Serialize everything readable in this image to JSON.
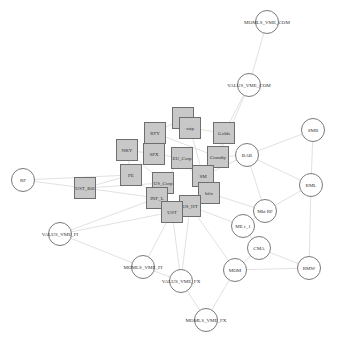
{
  "graph": {
    "colors": {
      "square_fill": "#c8c8c8",
      "square_border": "#6e6e6e",
      "circle_border": "#7a7a7a",
      "edge": "#d9d9d9"
    },
    "square_nodes": [
      {
        "id": "dny",
        "label": "dny",
        "x": 183,
        "y": 118
      },
      {
        "id": "sstp",
        "label": "sstp",
        "x": 190,
        "y": 128
      },
      {
        "id": "RTY",
        "label": "RTY",
        "x": 155,
        "y": 133
      },
      {
        "id": "Golds",
        "label": "Golds",
        "x": 224,
        "y": 133
      },
      {
        "id": "NKY",
        "label": "NKY",
        "x": 127,
        "y": 150
      },
      {
        "id": "SPX",
        "label": "SPX",
        "x": 154,
        "y": 154
      },
      {
        "id": "EU_Corp",
        "label": "EU_Corp",
        "x": 182,
        "y": 158
      },
      {
        "id": "Comdty",
        "label": "Comdty",
        "x": 218,
        "y": 157
      },
      {
        "id": "PE",
        "label": "PE",
        "x": 131,
        "y": 175
      },
      {
        "id": "US_Corp",
        "label": "US_Corp",
        "x": 163,
        "y": 183
      },
      {
        "id": "SM",
        "label": "SM",
        "x": 203,
        "y": 176
      },
      {
        "id": "bfix",
        "label": "bfix",
        "x": 209,
        "y": 193
      },
      {
        "id": "UST_Bill",
        "label": "UST_Bill",
        "x": 85,
        "y": 188
      },
      {
        "id": "INF_L",
        "label": "INF_L",
        "x": 157,
        "y": 198
      },
      {
        "id": "US_HT",
        "label": "US_HT",
        "x": 190,
        "y": 206
      },
      {
        "id": "UST",
        "label": "UST",
        "x": 172,
        "y": 212
      }
    ],
    "circle_nodes": [
      {
        "id": "MOMLS_VME_COM",
        "label": "MOMLS_VME_COM",
        "x": 267,
        "y": 22
      },
      {
        "id": "VALUS_VME_COM",
        "label": "VALUS_VME_COM",
        "x": 249,
        "y": 85
      },
      {
        "id": "SMB",
        "label": "SMB",
        "x": 313,
        "y": 130
      },
      {
        "id": "BAB",
        "label": "BAB",
        "x": 247,
        "y": 155
      },
      {
        "id": "RF",
        "label": "RF",
        "x": 23,
        "y": 180
      },
      {
        "id": "RML",
        "label": "RML",
        "x": 311,
        "y": 185
      },
      {
        "id": "Mkt_RF",
        "label": "Mkt RF",
        "x": 265,
        "y": 211
      },
      {
        "id": "ME_r_1",
        "label": "ME r_1",
        "x": 243,
        "y": 226
      },
      {
        "id": "VALUS_VME_FI",
        "label": "VALUS_VME_FI",
        "x": 60,
        "y": 234
      },
      {
        "id": "CMA",
        "label": "CMA",
        "x": 259,
        "y": 248
      },
      {
        "id": "MOMLS_VME_FI",
        "label": "MOMLS_VME_FI",
        "x": 143,
        "y": 267
      },
      {
        "id": "MOM",
        "label": "MOM",
        "x": 235,
        "y": 270
      },
      {
        "id": "RMW",
        "label": "RMW",
        "x": 309,
        "y": 268
      },
      {
        "id": "VALUS_VME_FX",
        "label": "VALUS_VME_FX",
        "x": 181,
        "y": 281
      },
      {
        "id": "MOMLS_VME_FX",
        "label": "MOMLS_VME_FX",
        "x": 206,
        "y": 320
      }
    ],
    "edges": [
      [
        "MOMLS_VME_COM",
        "VALUS_VME_COM"
      ],
      [
        "VALUS_VME_COM",
        "Golds"
      ],
      [
        "VALUS_VME_COM",
        "Comdty"
      ],
      [
        "SMB",
        "BAB"
      ],
      [
        "SMB",
        "RML"
      ],
      [
        "BAB",
        "Comdty"
      ],
      [
        "BAB",
        "Mkt_RF"
      ],
      [
        "BAB",
        "RML"
      ],
      [
        "BAB",
        "SM"
      ],
      [
        "RML",
        "Mkt_RF"
      ],
      [
        "RML",
        "RMW"
      ],
      [
        "Mkt_RF",
        "ME_r_1"
      ],
      [
        "Mkt_RF",
        "bfix"
      ],
      [
        "ME_r_1",
        "CMA"
      ],
      [
        "ME_r_1",
        "US_HT"
      ],
      [
        "CMA",
        "RMW"
      ],
      [
        "CMA",
        "MOM"
      ],
      [
        "MOM",
        "RMW"
      ],
      [
        "MOM",
        "MOMLS_VME_FX"
      ],
      [
        "MOM",
        "US_HT"
      ],
      [
        "RF",
        "UST_Bill"
      ],
      [
        "RF",
        "PE"
      ],
      [
        "UST_Bill",
        "INF_L"
      ],
      [
        "UST_Bill",
        "PE"
      ],
      [
        "UST_Bill",
        "US_Corp"
      ],
      [
        "VALUS_VME_FI",
        "INF_L"
      ],
      [
        "VALUS_VME_FI",
        "UST"
      ],
      [
        "VALUS_VME_FI",
        "MOMLS_VME_FI"
      ],
      [
        "MOMLS_VME_FI",
        "UST"
      ],
      [
        "MOMLS_VME_FI",
        "VALUS_VME_FX"
      ],
      [
        "VALUS_VME_FX",
        "MOMLS_VME_FX"
      ],
      [
        "VALUS_VME_FX",
        "US_HT"
      ],
      [
        "VALUS_VME_FX",
        "UST"
      ],
      [
        "NKY",
        "SPX"
      ],
      [
        "SPX",
        "RTY"
      ],
      [
        "SPX",
        "EU_Corp"
      ],
      [
        "RTY",
        "dny"
      ],
      [
        "dny",
        "sstp"
      ],
      [
        "sstp",
        "Golds"
      ],
      [
        "EU_Corp",
        "US_Corp"
      ],
      [
        "US_Corp",
        "INF_L"
      ],
      [
        "INF_L",
        "UST"
      ],
      [
        "UST",
        "US_HT"
      ],
      [
        "US_HT",
        "bfix"
      ],
      [
        "bfix",
        "SM"
      ],
      [
        "SM",
        "Comdty"
      ],
      [
        "Comdty",
        "Golds"
      ],
      [
        "PE",
        "SPX"
      ],
      [
        "PE",
        "NKY"
      ],
      [
        "EU_Corp",
        "SM"
      ],
      [
        "NKY",
        "US_Corp"
      ],
      [
        "RTY",
        "Comdty"
      ],
      [
        "sstp",
        "SM"
      ],
      [
        "EU_Corp",
        "bfix"
      ],
      [
        "PE",
        "INF_L"
      ]
    ]
  }
}
